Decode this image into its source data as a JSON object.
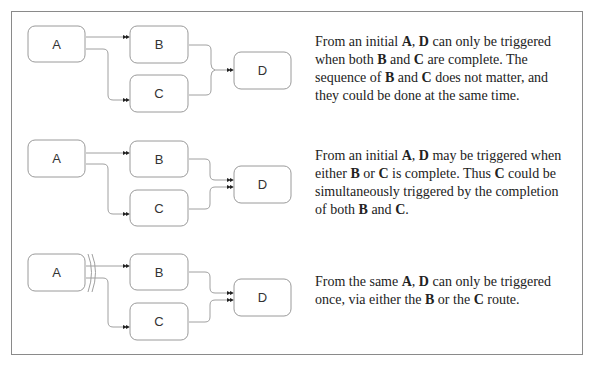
{
  "rows": [
    {
      "id": "and-join",
      "nodes": {
        "a": "A",
        "b": "B",
        "c": "C",
        "d": "D"
      },
      "join_type": "synchronizing-merge",
      "description": [
        {
          "t": "From an initial "
        },
        {
          "t": "A",
          "b": true
        },
        {
          "t": ", "
        },
        {
          "t": "D",
          "b": true
        },
        {
          "t": " can only be triggered when both "
        },
        {
          "t": "B",
          "b": true
        },
        {
          "t": " and "
        },
        {
          "t": "C",
          "b": true
        },
        {
          "t": " are complete. The sequence of "
        },
        {
          "t": "B",
          "b": true
        },
        {
          "t": " and "
        },
        {
          "t": "C",
          "b": true
        },
        {
          "t": " does not matter, and they could be done at the same time."
        }
      ]
    },
    {
      "id": "multi-merge",
      "nodes": {
        "a": "A",
        "b": "B",
        "c": "C",
        "d": "D"
      },
      "join_type": "multi-merge",
      "description": [
        {
          "t": "From an initial "
        },
        {
          "t": "A",
          "b": true
        },
        {
          "t": ", "
        },
        {
          "t": "D",
          "b": true
        },
        {
          "t": " may be triggered when either "
        },
        {
          "t": "B",
          "b": true
        },
        {
          "t": " or "
        },
        {
          "t": "C",
          "b": true
        },
        {
          "t": " is complete. Thus "
        },
        {
          "t": "C",
          "b": true
        },
        {
          "t": " could be simultaneously triggered by the completion of both "
        },
        {
          "t": "B",
          "b": true
        },
        {
          "t": " and "
        },
        {
          "t": "C",
          "b": true
        },
        {
          "t": "."
        }
      ]
    },
    {
      "id": "exclusive-choice",
      "nodes": {
        "a": "A",
        "b": "B",
        "c": "C",
        "d": "D"
      },
      "join_type": "exclusive-merge",
      "description": [
        {
          "t": "From the same "
        },
        {
          "t": "A",
          "b": true
        },
        {
          "t": ", "
        },
        {
          "t": "D",
          "b": true
        },
        {
          "t": " can only be triggered once, via either the "
        },
        {
          "t": "B",
          "b": true
        },
        {
          "t": " or the "
        },
        {
          "t": "C",
          "b": true
        },
        {
          "t": " route."
        }
      ]
    }
  ]
}
